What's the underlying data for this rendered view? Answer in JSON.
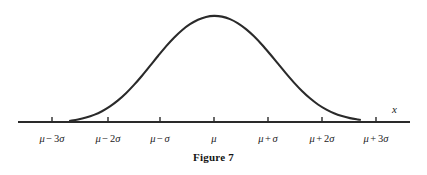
{
  "figure": {
    "caption": "Figure 7",
    "axis_x_label": "x",
    "stroke_color": "#2a2a2a",
    "axis_color": "#2a2a2a",
    "background_color": "#ffffff"
  },
  "ticks": [
    {
      "label": "μ − 3σ",
      "mu": "μ",
      "op": "−",
      "term": "3σ",
      "x": 52
    },
    {
      "label": "μ − 2σ",
      "mu": "μ",
      "op": "−",
      "term": "2σ",
      "x": 108
    },
    {
      "label": "μ − σ",
      "mu": "μ",
      "op": "−",
      "term": "σ",
      "x": 160
    },
    {
      "label": "μ",
      "mu": "μ",
      "op": "",
      "term": "",
      "x": 214
    },
    {
      "label": "μ + σ",
      "mu": "μ",
      "op": "+",
      "term": "σ",
      "x": 268
    },
    {
      "label": "μ + 2σ",
      "mu": "μ",
      "op": "+",
      "term": "2σ",
      "x": 322
    },
    {
      "label": "μ + 3σ",
      "mu": "μ",
      "op": "+",
      "term": "3σ",
      "x": 376
    }
  ],
  "chart_data": {
    "type": "line",
    "title": "Figure 7",
    "subtitle": "",
    "xlabel": "x",
    "ylabel": "",
    "grid": false,
    "legend": null,
    "annotations": [],
    "axis": {
      "line_y_px": 122,
      "x_start_px": 18,
      "x_end_px": 410,
      "arrow": false
    },
    "categories": [
      "μ − 3σ",
      "μ − 2σ",
      "μ − σ",
      "μ",
      "μ + σ",
      "μ + 2σ",
      "μ + 3σ"
    ],
    "x": [
      -3,
      -2,
      -1,
      0,
      1,
      2,
      3
    ],
    "series": [
      {
        "name": "normal density",
        "description": "Gaussian bell curve centered at mu, drawn from mu-3sigma to mu+3sigma",
        "values": [
          0.0111,
          0.1353,
          0.6065,
          1.0,
          0.6065,
          0.1353,
          0.0111
        ]
      }
    ],
    "xlim": [
      -3.6,
      3.6
    ],
    "ylim": [
      0,
      1.08
    ],
    "curve_points_px": [
      [
        70.0,
        120.8
      ],
      [
        78.0,
        119.5
      ],
      [
        86.0,
        117.6
      ],
      [
        94.0,
        114.9
      ],
      [
        102.0,
        111.2
      ],
      [
        110.0,
        106.4
      ],
      [
        118.0,
        100.4
      ],
      [
        126.0,
        93.2
      ],
      [
        134.0,
        84.9
      ],
      [
        142.0,
        75.7
      ],
      [
        150.0,
        65.9
      ],
      [
        158.0,
        56.0
      ],
      [
        166.0,
        46.4
      ],
      [
        174.0,
        37.7
      ],
      [
        182.0,
        30.2
      ],
      [
        190.0,
        24.2
      ],
      [
        198.0,
        19.7
      ],
      [
        206.0,
        16.9
      ],
      [
        214.0,
        15.9
      ],
      [
        222.0,
        16.6
      ],
      [
        230.0,
        19.1
      ],
      [
        238.0,
        23.3
      ],
      [
        246.0,
        29.1
      ],
      [
        254.0,
        36.3
      ],
      [
        262.0,
        44.7
      ],
      [
        270.0,
        54.0
      ],
      [
        278.0,
        63.7
      ],
      [
        286.0,
        73.4
      ],
      [
        294.0,
        82.6
      ],
      [
        302.0,
        91.0
      ],
      [
        310.0,
        98.3
      ],
      [
        318.0,
        104.5
      ],
      [
        326.0,
        109.4
      ],
      [
        334.0,
        113.3
      ],
      [
        342.0,
        116.1
      ],
      [
        350.0,
        118.1
      ],
      [
        358.0,
        119.5
      ],
      [
        360.0,
        119.8
      ]
    ]
  }
}
